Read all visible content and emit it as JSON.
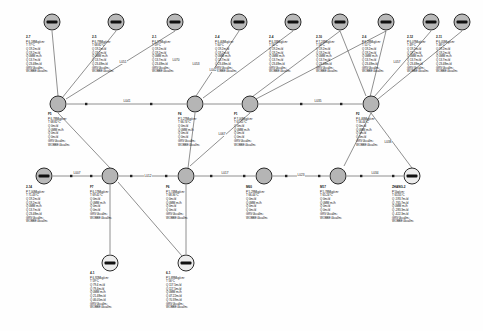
{
  "diagram": {
    "param_keys": {
      "pressure": "P",
      "temperature": "T",
      "q1": "Q",
      "q2": "Q",
      "q3": "Q",
      "q4": "Q",
      "q5": "Q",
      "grv": "GRV",
      "wobbe": "WOBBE"
    },
    "source_nodes": [
      {
        "id": "2-7",
        "x": 52,
        "y": 22,
        "lx": 26,
        "ly": 36,
        "p": "P 6.18Mkg/cm²",
        "t": "T 77°C",
        "q": [
          "Q 19.2m³/d",
          "Q 19.2m³/d",
          "Q 0MM m³/h",
          "Q 13.7m³/d",
          "Q 23.48m³/d"
        ],
        "grv": "GRV 0kcal/m³",
        "wobbe": "WOBBE 0kcal/m³"
      },
      {
        "id": "2-5",
        "x": 116,
        "y": 22,
        "lx": 92,
        "ly": 36,
        "p": "P 6.79Mkg/cm²",
        "t": "T 68.82°C",
        "q": [
          "Q 19.2m³/d",
          "Q 19.2m³/d",
          "Q 0MM m³/h",
          "Q 13.7m³/d",
          "Q 23.48m³/d"
        ],
        "grv": "GRV 0kcal/m³",
        "wobbe": "WOBBE 0kcal/m³"
      },
      {
        "id": "2-1",
        "x": 175,
        "y": 22,
        "lx": 152,
        "ly": 36,
        "p": "P 6.37Mkg/cm²",
        "t": "T 59°C",
        "q": [
          "Q 19.2m³/d",
          "Q 19.2m³/d",
          "Q 0MM m³/h",
          "Q 13.7m³/d",
          "Q 23.48m³/d"
        ],
        "grv": "GRV 0kcal/m³",
        "wobbe": "WOBBE 0kcal/m³"
      },
      {
        "id": "2-4",
        "x": 239,
        "y": 22,
        "lx": 215,
        "ly": 36,
        "p": "P 6.40Mkg/cm²",
        "t": "T 60°C",
        "q": [
          "Q 19.2m³/d",
          "Q 19.2m³/d",
          "Q 0MM m³/h",
          "Q 13.7m³/d",
          "Q 23.48m³/d"
        ],
        "grv": "GRV 0kcal/m³",
        "wobbe": "WOBBE 0kcal/m³"
      },
      {
        "id": "2-4",
        "x": 293,
        "y": 22,
        "lx": 269,
        "ly": 36,
        "p": "P 6.33Mkg/cm²",
        "t": "T 56°C",
        "q": [
          "Q 19.2m³/d",
          "Q 19.2m³/d",
          "Q 0MM m³/h",
          "Q 13.7m³/d",
          "Q 23.48m³/d"
        ],
        "grv": "GRV 0kcal/m³",
        "wobbe": "WOBBE 0kcal/m³"
      },
      {
        "id": "2-10",
        "x": 340,
        "y": 22,
        "lx": 316,
        "ly": 36,
        "p": "P 7.24Mkg/cm²",
        "t": "T 58°C",
        "q": [
          "Q 19.2m³/d",
          "Q 19.2m³/d",
          "Q 0MM m³/h",
          "Q 13.7m³/d",
          "Q 23.48m³/d"
        ],
        "grv": "GRV 0kcal/m³",
        "wobbe": "WOBBE 0kcal/m³"
      },
      {
        "id": "2-6",
        "x": 386,
        "y": 22,
        "lx": 362,
        "ly": 36,
        "p": "P 6.28Mkg/cm²",
        "t": "T 51°C",
        "q": [
          "Q 19.2m³/d",
          "Q 19.2m³/d",
          "Q 0MM m³/h",
          "Q 13.7m³/d",
          "Q 23.48m³/d"
        ],
        "grv": "GRV 0kcal/m³",
        "wobbe": "WOBBE 0kcal/m³"
      },
      {
        "id": "2-12",
        "x": 431,
        "y": 22,
        "lx": 407,
        "ly": 36,
        "p": "P 6.07Mkg/cm²",
        "t": "T 49°C",
        "q": [
          "Q 19.2m³/d",
          "Q 19.2m³/d",
          "Q 0MM m³/h",
          "Q 13.7m³/d",
          "Q 23.48m³/d"
        ],
        "grv": "GRV 0kcal/m³",
        "wobbe": "WOBBE 0kcal/m³"
      },
      {
        "id": "2-11",
        "x": 462,
        "y": 22,
        "lx": 436,
        "ly": 36,
        "p": "P 6.05Mkg/cm²",
        "t": "T 48°C",
        "q": [
          "Q 19.2m³/d",
          "Q 19.2m³/d",
          "Q 0MM m³/h",
          "Q 13.7m³/d",
          "Q 23.48m³/d"
        ],
        "grv": "GRV 0kcal/m³",
        "wobbe": "WOBBE 0kcal/m³"
      }
    ],
    "junction_nodes": [
      {
        "id": "F5",
        "x": 58,
        "y": 104,
        "lx": 48,
        "ly": 113,
        "p": "P 6.78Mkg/cm²",
        "t": "T 68.82°C",
        "q": [
          "Q 0m³/d",
          "Q 0MM m³/h",
          "Q 0m³/d",
          "Q 0m³/d"
        ],
        "grv": "GRV 0kcal/m³",
        "wobbe": "WOBBE 0kcal/m³"
      },
      {
        "id": "F4",
        "x": 195,
        "y": 104,
        "lx": 178,
        "ly": 113,
        "p": "P 5.27Mkg/cm²",
        "t": "T 66.74°C",
        "q": [
          "Q 0m³/d",
          "Q 0MM m³/h",
          "Q 0m³/d",
          "Q 0m³/d"
        ],
        "grv": "GRV 0kcal/m³",
        "wobbe": "WOBBE 0kcal/m³"
      },
      {
        "id": "F1",
        "x": 250,
        "y": 104,
        "lx": 234,
        "ly": 113,
        "p": "P 7.00Mkg/cm²",
        "t": "T 67.01°C",
        "q": [
          "Q 0m³/d",
          "Q 0MM m³/h",
          "Q 0m³/d",
          "Q 0m³/d"
        ],
        "grv": "GRV 0kcal/m³",
        "wobbe": "WOBBE 0kcal/m³"
      },
      {
        "id": "F2",
        "x": 371,
        "y": 104,
        "lx": 356,
        "ly": 113,
        "p": "P 6.46Mkg/cm²",
        "t": "T 56.44°C",
        "q": [
          "Q 0m³/d",
          "Q 0MM m³/h",
          "Q 0m³/d",
          "Q 0m³/d"
        ],
        "grv": "GRV 0kcal/m³",
        "wobbe": "WOBBE 0kcal/m³"
      }
    ],
    "chain_nodes": [
      {
        "id": "2-14",
        "x": 44,
        "y": 176,
        "lx": 26,
        "ly": 186,
        "kind": "source",
        "p": "P 7.00Mkg/cm²",
        "t": "T 71.43°C",
        "q": [
          "Q 19.2m³/d",
          "Q 19.2m³/d",
          "Q 0MM m³/h",
          "Q 13.7m³/d",
          "Q 23.48m³/d"
        ],
        "grv": "GRV 0kcal/m³",
        "wobbe": "WOBBE 0kcal/m³"
      },
      {
        "id": "F7",
        "x": 110,
        "y": 176,
        "lx": 90,
        "ly": 186,
        "kind": "junction",
        "p": "P 6.17Mkg/cm²",
        "t": "T 69.41°C",
        "q": [
          "Q 0m³/d",
          "Q 0MM m³/h",
          "Q 0m³/d",
          "Q 0m³/d"
        ],
        "grv": "GRV 0kcal/m³",
        "wobbe": "WOBBE 0kcal/m³"
      },
      {
        "id": "F6",
        "x": 186,
        "y": 176,
        "lx": 166,
        "ly": 186,
        "kind": "junction",
        "p": "P 5.74Mkg/cm²",
        "t": "T 68.36°C",
        "q": [
          "Q 0m³/d",
          "Q 0MM m³/h",
          "Q 0m³/d",
          "Q 0m³/d"
        ],
        "grv": "GRV 0kcal/m³",
        "wobbe": "WOBBE 0kcal/m³"
      },
      {
        "id": "M60",
        "x": 264,
        "y": 176,
        "lx": 246,
        "ly": 186,
        "kind": "junction",
        "p": "P 5.29Mkg/cm²",
        "t": "T 66.44°C",
        "q": [
          "Q 0m³/d",
          "Q 0MM m³/h",
          "Q 0m³/d",
          "Q 0m³/d"
        ],
        "grv": "GRV 0kcal/m³",
        "wobbe": "WOBBE 0kcal/m³"
      },
      {
        "id": "M17",
        "x": 338,
        "y": 176,
        "lx": 320,
        "ly": 186,
        "kind": "junction",
        "p": "P 5.78Mkg/cm²",
        "t": "T 65.24°C",
        "q": [
          "Q 0m³/d",
          "Q 0MM m³/h",
          "Q 0m³/d",
          "Q 0m³/d"
        ],
        "grv": "GRV 0kcal/m³",
        "wobbe": "WOBBE 0kcal/m³"
      },
      {
        "id": "ZHANG-2",
        "x": 412,
        "y": 176,
        "lx": 392,
        "ly": 186,
        "kind": "sink",
        "p": "P 5kg/cm²",
        "t": "T 65.05°C",
        "q": [
          "Q -593.7m³/d",
          "Q -765.7m³/d",
          "Q 0MM m³/h",
          "Q -283.3m³/d",
          "Q -422.3m³/d"
        ],
        "grv": "GRV 0kcal/m³",
        "wobbe": "WOBBE 0kcal/m³"
      }
    ],
    "bottom_nodes": [
      {
        "id": "4-1",
        "x": 110,
        "y": 263,
        "lx": 90,
        "ly": 272,
        "p": "P 6.92Mkg/cm²",
        "t": "T 59°C",
        "q": [
          "Q 79.4 m³/d",
          "Q 79.4m³/d",
          "Q 0MM m³/h",
          "Q 21.48m³/d",
          "Q 46.05m³/d"
        ],
        "grv": "GRV 0kcal/m³",
        "wobbe": "WOBBE 0kcal/m³"
      },
      {
        "id": "6-1",
        "x": 186,
        "y": 263,
        "lx": 166,
        "ly": 272,
        "p": "P 5.89Mkg/cm²",
        "t": "T 56°C",
        "q": [
          "Q 117.5m³/d",
          "Q 117.5m³/d",
          "Q 0MM m³/h",
          "Q 47.22m³/d",
          "Q 70.39m³/d"
        ],
        "grv": "GRV 0kcal/m³",
        "wobbe": "WOBBE 0kcal/m³"
      }
    ],
    "links": [
      {
        "label": "L051",
        "x": 123,
        "y": 62
      },
      {
        "label": "L053",
        "x": 196,
        "y": 64
      },
      {
        "label": "L070",
        "x": 176,
        "y": 60
      },
      {
        "label": "L042",
        "x": 213,
        "y": 70
      },
      {
        "label": "L057",
        "x": 397,
        "y": 62
      },
      {
        "label": "L041",
        "x": 127,
        "y": 101
      },
      {
        "label": "L067",
        "x": 222,
        "y": 134
      },
      {
        "label": "L035",
        "x": 318,
        "y": 101
      },
      {
        "label": "L038",
        "x": 388,
        "y": 142
      },
      {
        "label": "L007",
        "x": 77,
        "y": 173
      },
      {
        "label": "L012",
        "x": 148,
        "y": 176
      },
      {
        "label": "L017",
        "x": 225,
        "y": 173
      },
      {
        "label": "L023",
        "x": 301,
        "y": 175
      },
      {
        "label": "L034",
        "x": 375,
        "y": 173
      }
    ]
  }
}
